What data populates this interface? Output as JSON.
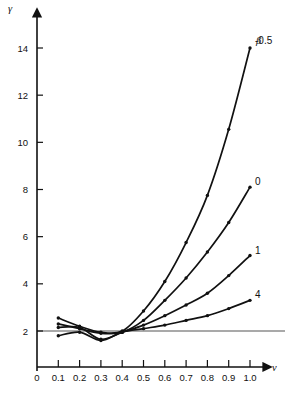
{
  "chart_data": {
    "type": "line",
    "title": "",
    "subtitle": "",
    "xlabel": "ν",
    "ylabel": "γ",
    "xlim": [
      0,
      1.05
    ],
    "ylim": [
      0,
      15.2
    ],
    "grid": false,
    "legend_position": "right-inline",
    "legend_symbol": "β",
    "x_ticks": [
      "0",
      "0.1",
      "0.2",
      "0.3",
      "0.4",
      "0.5",
      "0.6",
      "0.7",
      "0.8",
      "0.9",
      "1.0"
    ],
    "x_tick_values": [
      0,
      0.1,
      0.2,
      0.3,
      0.4,
      0.5,
      0.6,
      0.7,
      0.8,
      0.9,
      1.0
    ],
    "y_ticks": [
      "2",
      "4",
      "6",
      "8",
      "10",
      "12",
      "14"
    ],
    "y_tick_values": [
      2,
      4,
      6,
      8,
      10,
      12,
      14
    ],
    "reference_lines": [
      {
        "name": "gamma-equals-two",
        "axis": "horizontal",
        "value": 2
      }
    ],
    "x": [
      0.1,
      0.2,
      0.3,
      0.4,
      0.5,
      0.6,
      0.7,
      0.8,
      0.9,
      1.0
    ],
    "series": [
      {
        "name": "beta-minus-0-5",
        "label": "-0.5",
        "values": [
          2.55,
          2.2,
          1.95,
          2.0,
          2.85,
          4.1,
          5.75,
          7.75,
          10.55,
          14.0
        ]
      },
      {
        "name": "beta-0",
        "label": "0",
        "values": [
          2.3,
          2.1,
          1.9,
          1.95,
          2.45,
          3.3,
          4.25,
          5.35,
          6.6,
          8.1
        ]
      },
      {
        "name": "beta-1",
        "label": "1",
        "values": [
          2.15,
          2.15,
          1.65,
          1.95,
          2.25,
          2.65,
          3.1,
          3.6,
          4.35,
          5.2
        ]
      },
      {
        "name": "beta-4",
        "label": "4",
        "values": [
          1.8,
          1.95,
          1.6,
          1.95,
          2.1,
          2.25,
          2.45,
          2.65,
          2.95,
          3.3
        ]
      }
    ]
  }
}
